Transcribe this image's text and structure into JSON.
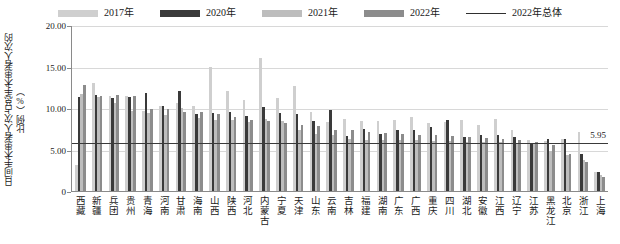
{
  "legend": {
    "items": [
      {
        "label": "2017年",
        "type": "swatch",
        "color": "#cfcfcf",
        "name": "legend-2017"
      },
      {
        "label": "2020年",
        "type": "swatch",
        "color": "#3a3a3a",
        "name": "legend-2020"
      },
      {
        "label": "2021年",
        "type": "swatch",
        "color": "#bdbdbd",
        "name": "legend-2021"
      },
      {
        "label": "2022年",
        "type": "swatch",
        "color": "#8c8c8c",
        "name": "legend-2022"
      },
      {
        "label": "2022年总体",
        "type": "line",
        "color": "#2f2f2f",
        "name": "legend-2022-overall"
      }
    ]
  },
  "axes": {
    "ylabel": "日间手术患者人次占总手术患者人次的比例（%）",
    "yticks": [
      "20.00",
      "15.00",
      "10.00",
      "5.00",
      "0"
    ],
    "ytick_values": [
      20,
      15,
      10,
      5,
      0
    ]
  },
  "reference": {
    "label": "5.95",
    "value": 5.95
  },
  "chart_data": {
    "type": "bar",
    "title": "",
    "xlabel": "",
    "ylabel": "日间手术患者人次占总手术患者人次的比例（%）",
    "ylim": [
      0,
      20
    ],
    "yticks": [
      0,
      5,
      10,
      15,
      20
    ],
    "grid": true,
    "legend_position": "top-center",
    "reference_line": {
      "name": "2022年总体",
      "value": 5.95
    },
    "categories": [
      "西藏",
      "新疆",
      "兵团",
      "贵州",
      "青海",
      "河南",
      "甘肃",
      "海南",
      "山西",
      "陕西",
      "河北",
      "内蒙古",
      "宁夏",
      "天津",
      "山东",
      "云南",
      "吉林",
      "福建",
      "湖南",
      "广东",
      "广西",
      "重庆",
      "四川",
      "湖北",
      "安徽",
      "江西",
      "辽宁",
      "江苏",
      "黑龙江",
      "北京",
      "浙江",
      "上海"
    ],
    "series": [
      {
        "name": "2017年",
        "color": "#cfcfcf",
        "values": [
          3.1,
          13.0,
          11.4,
          11.5,
          9.7,
          10.2,
          10.6,
          10.3,
          14.9,
          12.0,
          11.0,
          16.0,
          11.2,
          12.7,
          9.5,
          8.3,
          8.7,
          8.4,
          8.4,
          8.5,
          8.9,
          8.2,
          8.3,
          8.5,
          8.0,
          8.7,
          7.4,
          6.1,
          6.0,
          6.3,
          7.1,
          2.3
        ]
      },
      {
        "name": "2020年",
        "color": "#3a3a3a",
        "values": [
          11.3,
          11.6,
          11.2,
          11.3,
          11.8,
          10.3,
          12.1,
          9.3,
          9.4,
          9.5,
          9.0,
          10.1,
          9.4,
          9.3,
          8.4,
          9.8,
          6.6,
          7.5,
          6.9,
          7.4,
          7.3,
          7.7,
          8.5,
          6.5,
          6.8,
          6.8,
          6.5,
          5.8,
          6.3,
          6.3,
          4.4,
          2.3
        ]
      },
      {
        "name": "2021年",
        "color": "#bdbdbd",
        "values": [
          11.7,
          11.3,
          10.6,
          9.6,
          9.4,
          9.2,
          10.0,
          8.8,
          8.5,
          8.6,
          8.3,
          8.7,
          8.4,
          7.4,
          6.9,
          6.8,
          6.3,
          6.2,
          6.2,
          6.1,
          6.2,
          6.0,
          6.0,
          5.9,
          5.9,
          5.9,
          5.7,
          5.8,
          4.8,
          4.3,
          3.7,
          1.9
        ]
      },
      {
        "name": "2022年",
        "color": "#8c8c8c",
        "values": [
          12.8,
          11.5,
          11.6,
          11.4,
          9.9,
          9.9,
          9.5,
          9.5,
          9.3,
          8.9,
          8.5,
          8.4,
          8.2,
          8.0,
          7.8,
          7.4,
          7.3,
          7.1,
          7.0,
          6.9,
          6.8,
          6.7,
          6.6,
          6.5,
          6.4,
          6.3,
          6.1,
          5.9,
          5.6,
          4.5,
          3.5,
          1.7
        ]
      }
    ]
  }
}
